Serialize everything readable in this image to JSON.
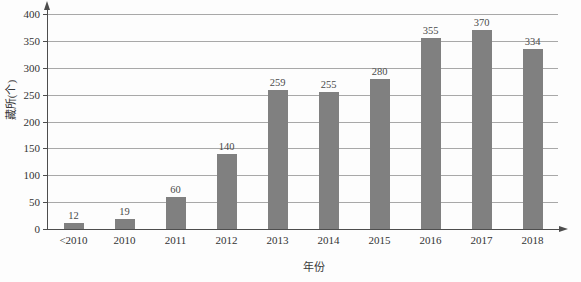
{
  "chart_data": {
    "type": "bar",
    "title": "",
    "xlabel": "年份",
    "ylabel": "藏所(个)",
    "categories": [
      "<2010",
      "2010",
      "2011",
      "2012",
      "2013",
      "2014",
      "2015",
      "2016",
      "2017",
      "2018"
    ],
    "values": [
      12,
      19,
      60,
      140,
      259,
      255,
      280,
      355,
      370,
      334
    ],
    "value_labels": [
      "12",
      "19",
      "60",
      "140",
      "259",
      "255",
      "280",
      "355",
      "370",
      "334"
    ],
    "ylim": [
      0,
      400
    ],
    "ytick_labels": [
      "400",
      "350",
      "300",
      "250",
      "200",
      "150",
      "100",
      "50",
      "0"
    ],
    "yticks": [
      400,
      350,
      300,
      250,
      200,
      150,
      100,
      50,
      0
    ],
    "grid": true,
    "legend": null,
    "series": [
      {
        "name": "",
        "values": [
          12,
          19,
          60,
          140,
          259,
          255,
          280,
          355,
          370,
          334
        ]
      }
    ],
    "colors": {
      "bar": "#808080",
      "gridline": "#a8a8a8",
      "axis": "#4d4d4d",
      "text": "#333333",
      "background": "#fdfdfd"
    }
  }
}
